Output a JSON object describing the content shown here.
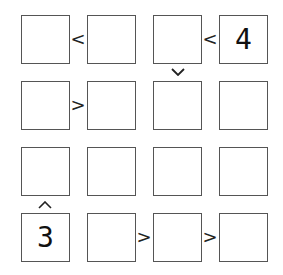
{
  "puzzle": {
    "type": "futoshiki",
    "size": 4,
    "cells": [
      [
        "",
        "",
        "",
        "4"
      ],
      [
        "",
        "",
        "",
        ""
      ],
      [
        "",
        "",
        "",
        ""
      ],
      [
        "3",
        "",
        "",
        ""
      ]
    ],
    "horizontal_constraints": [
      {
        "row": 0,
        "between": [
          0,
          1
        ],
        "symbol": "<"
      },
      {
        "row": 0,
        "between": [
          2,
          3
        ],
        "symbol": "<"
      },
      {
        "row": 1,
        "between": [
          0,
          1
        ],
        "symbol": ">"
      },
      {
        "row": 3,
        "between": [
          1,
          2
        ],
        "symbol": ">"
      },
      {
        "row": 3,
        "between": [
          2,
          3
        ],
        "symbol": ">"
      }
    ],
    "vertical_constraints": [
      {
        "col": 2,
        "between": [
          0,
          1
        ],
        "symbol": "v"
      },
      {
        "col": 0,
        "between": [
          2,
          3
        ],
        "symbol": "^"
      }
    ],
    "h_signs": {
      "r0c0": "<",
      "r0c2": "<",
      "r1c0": ">",
      "r3c1": ">",
      "r3c2": ">"
    }
  }
}
